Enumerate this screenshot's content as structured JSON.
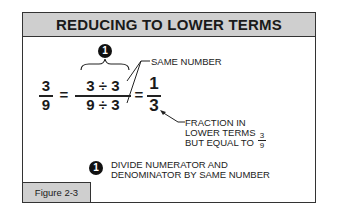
{
  "title": "REDUCING TO LOWER TERMS",
  "equation": {
    "left": {
      "numerator": "3",
      "denominator": "9"
    },
    "equals": "=",
    "middle": {
      "numerator": "3 ÷ 3",
      "denominator": "9 ÷ 3"
    },
    "right": {
      "numerator": "1",
      "denominator": "3"
    }
  },
  "step_marker": "1",
  "callouts": {
    "same_number": "SAME NUMBER",
    "fraction_line1": "FRACTION IN",
    "fraction_line2": "LOWER TERMS",
    "fraction_line3": "BUT EQUAL TO",
    "equal_to_numerator": "3",
    "equal_to_denominator": "9"
  },
  "note": {
    "marker": "1",
    "line1": "DIVIDE NUMERATOR AND",
    "line2": "DENOMINATOR BY SAME NUMBER"
  },
  "figure_label": "Figure 2-3"
}
